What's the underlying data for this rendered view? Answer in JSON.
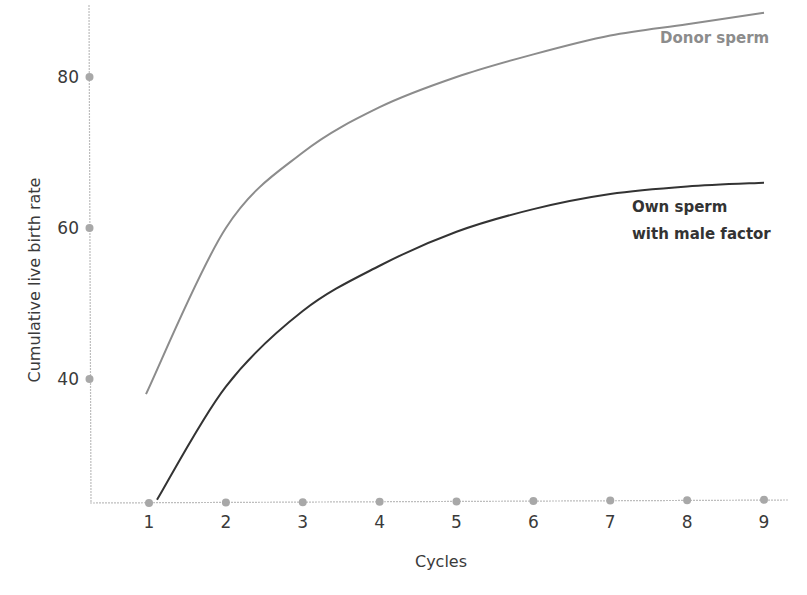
{
  "chart_data": {
    "type": "line",
    "title": "",
    "xlabel": "Cycles",
    "ylabel": "Cumulative live birth rate",
    "x": [
      1,
      2,
      3,
      4,
      5,
      6,
      7,
      8,
      9
    ],
    "x_ticks": [
      "1",
      "2",
      "3",
      "4",
      "5",
      "6",
      "7",
      "8",
      "9"
    ],
    "y_ticks": [
      "40",
      "60",
      "80"
    ],
    "y_tick_values": [
      40,
      60,
      80
    ],
    "ylim": [
      23.5,
      90
    ],
    "xlim": [
      0.2,
      9.1
    ],
    "grid": false,
    "legend_position": "inline-labels",
    "series": [
      {
        "name": "Donor sperm",
        "color": "#8c8c8c",
        "values": [
          38,
          60,
          70,
          76,
          80,
          83,
          85.5,
          87,
          88.5
        ]
      },
      {
        "name": "Own sperm with male factor",
        "color": "#333333",
        "values": [
          24,
          39,
          49,
          55,
          59.5,
          62.5,
          64.5,
          65.5,
          66
        ]
      }
    ]
  },
  "labels": {
    "donor": "Donor sperm",
    "own_line1": "Own sperm",
    "own_line2": "with male factor"
  },
  "colors": {
    "axis": "#bdbdbd",
    "tick_dot": "#a8a8a8",
    "donor": "#8c8c8c",
    "own": "#333333"
  }
}
